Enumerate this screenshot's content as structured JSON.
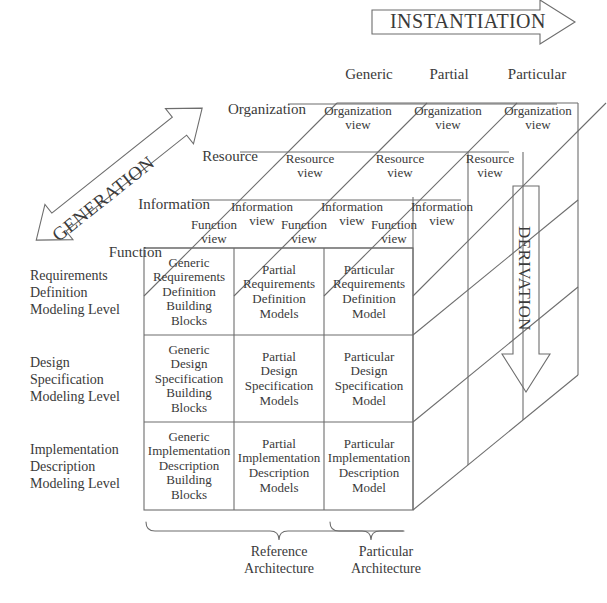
{
  "figure": {
    "axes": {
      "instantiation": "INSTANTIATION",
      "generation": "GENERATION",
      "derivation": "DERIVATION"
    },
    "instantiation_columns": [
      "Generic",
      "Partial",
      "Particular"
    ],
    "generation_rows": [
      "Organization",
      "Resource",
      "Information",
      "Function"
    ],
    "top_face_cells": [
      [
        "Organization\nview",
        "Organization\nview",
        "Organization\nview"
      ],
      [
        "Resource\nview",
        "Resource\nview",
        "Resource\nview"
      ],
      [
        "Information\nview",
        "Information\nview",
        "Information\nview"
      ],
      [
        "Function\nview",
        "Function\nview",
        "Function\nview"
      ]
    ],
    "modeling_levels": [
      "Requirements\nDefinition\nModeling Level",
      "Design\nSpecification\nModeling Level",
      "Implementation\nDescription\nModeling Level"
    ],
    "front_face_cells": [
      [
        "Generic\nRequirements\nDefinition\nBuilding\nBlocks",
        "Partial\nRequirements\nDefinition\nModels",
        "Particular\nRequirements\nDefinition\nModel"
      ],
      [
        "Generic\nDesign\nSpecification\nBuilding\nBlocks",
        "Partial\nDesign\nSpecification\nModels",
        "Particular\nDesign\nSpecification\nModel"
      ],
      [
        "Generic\nImplementation\nDescription\nBuilding\nBlocks",
        "Partial\nImplementation\nDescription\nModels",
        "Particular\nImplementation\nDescription\nModel"
      ]
    ],
    "architecture_braces": [
      "Reference\nArchitecture",
      "Particular\nArchitecture"
    ],
    "colors": {
      "stroke": "#6d6d6d",
      "text": "#3a3a3a",
      "background": "#ffffff"
    }
  }
}
